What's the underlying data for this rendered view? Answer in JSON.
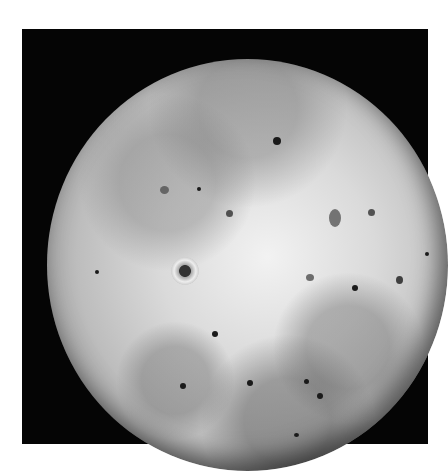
{
  "image": {
    "subject": "Io",
    "description": "Grayscale full-disk photograph of Jupiter's moon Io on a black square background",
    "background_color": "#050505",
    "page_color": "#ffffff",
    "frame": {
      "x": 22,
      "y": 29,
      "width": 406,
      "height": 415
    },
    "globe": {
      "cx": 225,
      "cy": 236,
      "r": 201
    },
    "features": [
      {
        "type": "halo-volcano",
        "x": 163,
        "y": 241,
        "r": 14
      },
      {
        "type": "dark-spot",
        "x": 276,
        "y": 111,
        "r": 4
      },
      {
        "type": "dark-spot",
        "x": 198,
        "y": 159,
        "r": 2
      },
      {
        "type": "dark-spot",
        "x": 229,
        "y": 184,
        "r": 3
      },
      {
        "type": "dark-spot",
        "x": 355,
        "y": 258,
        "r": 3
      },
      {
        "type": "dark-spot",
        "x": 96,
        "y": 243,
        "r": 2
      },
      {
        "type": "dark-spot",
        "x": 215,
        "y": 305,
        "r": 3
      },
      {
        "type": "dark-spot",
        "x": 250,
        "y": 354,
        "r": 3
      },
      {
        "type": "dark-spot",
        "x": 307,
        "y": 353,
        "r": 3
      },
      {
        "type": "dark-spot",
        "x": 320,
        "y": 367,
        "r": 3
      },
      {
        "type": "dark-spot",
        "x": 399,
        "y": 250,
        "r": 3
      },
      {
        "type": "dark-spot",
        "x": 371,
        "y": 183,
        "r": 3
      },
      {
        "type": "dark-spot",
        "x": 297,
        "y": 405,
        "r": 2
      },
      {
        "type": "dark-spot",
        "x": 405,
        "y": 225,
        "r": 2
      },
      {
        "type": "dark-spot",
        "x": 183,
        "y": 355,
        "r": 3
      },
      {
        "type": "dark-spot",
        "x": 288,
        "y": 247,
        "r": 4
      }
    ]
  }
}
